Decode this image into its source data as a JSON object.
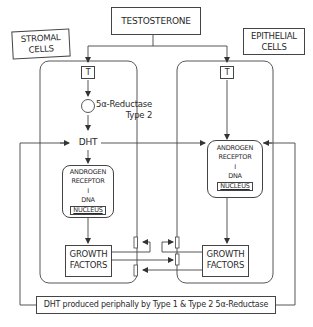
{
  "diagram": {
    "title_node": "TESTOSTERONE",
    "stromal": {
      "label_line1": "STROMAL",
      "label_line2": "CELLS",
      "t_label": "T",
      "enzyme_line1": "5α-Reductase",
      "enzyme_line2": "Type 2",
      "dht_label": "DHT",
      "receptor": {
        "line1": "ANDROGEN",
        "line2": "RECEPTOR",
        "line3": "I",
        "line4": "DNA",
        "line5": "NUCLEUS"
      },
      "growth_line1": "GROWTH",
      "growth_line2": "FACTORS"
    },
    "epithelial": {
      "label_line1": "EPITHELIAL",
      "label_line2": "CELLS",
      "t_label": "T",
      "receptor": {
        "line1": "ANDROGEN",
        "line2": "RECEPTOR",
        "line3": "I",
        "line4": "DNA",
        "line5": "NUCLEUS"
      },
      "growth_line1": "GROWTH",
      "growth_line2": "FACTORS"
    },
    "peripheral_note": "DHT produced periphally by Type 1 & Type 2 5α-Reductase",
    "colors": {
      "line": "#444444",
      "text": "#2a2a2a",
      "background": "#ffffff"
    }
  }
}
